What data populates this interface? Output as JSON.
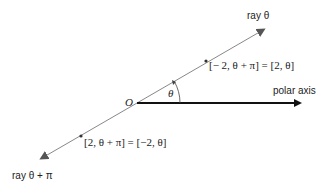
{
  "diagram": {
    "origin_label": "O",
    "angle_label": "θ",
    "polar_axis_label": "polar axis",
    "ray_theta_label": "ray θ",
    "ray_theta_pi_label": "ray θ + π",
    "point_upper_label": "[− 2, θ + π] = [2, θ]",
    "point_lower_label": "[2, θ + π] = [−2, θ]",
    "colors": {
      "ray": "#888888",
      "axis": "#111111",
      "text": "#222222"
    }
  }
}
